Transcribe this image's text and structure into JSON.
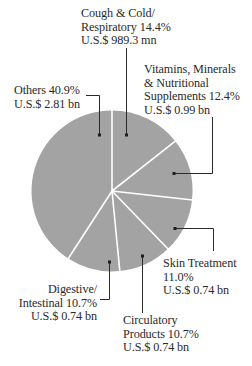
{
  "chart_data": {
    "type": "pie",
    "title": "",
    "start_angle_deg": 0,
    "direction": "clockwise",
    "fill_color": "#a3a3a3",
    "divider_color": "#ffffff",
    "leader_color": "#2a2a2a",
    "slices": [
      {
        "name": "Cough & Cold/ Respiratory",
        "percent": 14.4,
        "value_text": "U.S.$ 989.3 mn"
      },
      {
        "name": "Vitamins, Minerals & Nutritional Supplements",
        "percent": 12.4,
        "value_text": "U.S.$ 0.99 bn"
      },
      {
        "name": "Skin Treatment",
        "percent": 11.0,
        "value_text": "U.S.$ 0.74 bn"
      },
      {
        "name": "Circulatory Products",
        "percent": 10.7,
        "value_text": "U.S.$ 0.74 bn"
      },
      {
        "name": "Digestive/ Intestinal",
        "percent": 10.7,
        "value_text": "U.S.$ 0.74 bn"
      },
      {
        "name": "Others",
        "percent": 40.9,
        "value_text": "U.S.$ 2.81 bn"
      }
    ]
  },
  "labels": {
    "cough": {
      "line1": "Cough & Cold/",
      "line2": "Respiratory  14.4%",
      "line3": "U.S.$ 989.3 mn"
    },
    "vitamins": {
      "line1": "Vitamins, Minerals",
      "line2": "& Nutritional",
      "line3": "Supplements 12.4%",
      "line4": "U.S.$ 0.99 bn"
    },
    "others": {
      "line1": "Others 40.9%",
      "line2": "U.S.$ 2.81 bn"
    },
    "skin": {
      "line1": "Skin Treatment",
      "line2": "11.0%",
      "line3": "U.S.$ 0.74 bn"
    },
    "circulatory": {
      "line1": "Circulatory",
      "line2": "Products  10.7%",
      "line3": "U.S.$ 0.74 bn"
    },
    "digestive": {
      "line1": "Digestive/",
      "line2": "Intestinal  10.7%",
      "line3": "U.S.$ 0.74 bn"
    }
  }
}
